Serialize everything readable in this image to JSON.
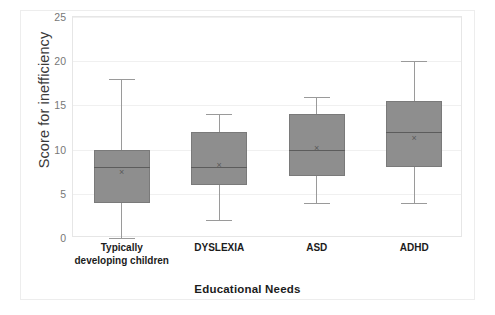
{
  "chart_data": {
    "type": "box",
    "title": "",
    "xlabel": "Educational Needs",
    "ylabel": "Score for inefficiency",
    "categories": [
      "Typically developing children",
      "DYSLEXIA",
      "ASD",
      "ADHD"
    ],
    "ylim": [
      0,
      25
    ],
    "yticks": [
      0,
      5,
      10,
      15,
      20,
      25
    ],
    "ytick_labels": [
      "0",
      "5",
      "10",
      "15",
      "20",
      "25"
    ],
    "grid": true,
    "legend": "none",
    "box_color": "#8e8e8e",
    "box_border_color": "#7a7a7a",
    "whisker_color": "#9a9a9a",
    "median_color": "#5c5c5c",
    "mean_marker_glyph": "×",
    "series": [
      {
        "name": "Typically developing children",
        "whisker_low": 0,
        "q1": 4,
        "median": 8,
        "q3": 10,
        "whisker_high": 18,
        "mean": 7.5
      },
      {
        "name": "DYSLEXIA",
        "whisker_low": 2,
        "q1": 6,
        "median": 8,
        "q3": 12,
        "whisker_high": 14,
        "mean": 8.3
      },
      {
        "name": "ASD",
        "whisker_low": 4,
        "q1": 7,
        "median": 10,
        "q3": 14,
        "whisker_high": 16,
        "mean": 10.2
      },
      {
        "name": "ADHD",
        "whisker_low": 4,
        "q1": 8,
        "median": 12,
        "q3": 15.5,
        "whisker_high": 20,
        "mean": 11.3
      }
    ]
  }
}
